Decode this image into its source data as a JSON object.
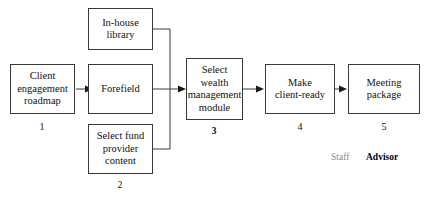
{
  "diagram": {
    "nodes": [
      {
        "id": "in-house-library",
        "label": "In-house\nlibrary",
        "number": "",
        "number_bold": false
      },
      {
        "id": "client-engagement",
        "label": "Client\nengagement\nroadmap",
        "number": "1",
        "number_bold": false
      },
      {
        "id": "forefield",
        "label": "Forefield",
        "number": "",
        "number_bold": false
      },
      {
        "id": "select-fund-provider",
        "label": "Select fund\nprovider\ncontent",
        "number": "2",
        "number_bold": false
      },
      {
        "id": "select-wealth-module",
        "label": "Select\nwealth\nmanagement\nmodule",
        "number": "3",
        "number_bold": true
      },
      {
        "id": "make-client-ready",
        "label": "Make\nclient-ready",
        "number": "4",
        "number_bold": false
      },
      {
        "id": "meeting-package",
        "label": "Meeting\npackage",
        "number": "5",
        "number_bold": false
      }
    ],
    "legend": {
      "staff": "Staff",
      "advisor": "Advisor",
      "staff_color": "#8a8a8a",
      "advisor_color": "#000000"
    },
    "colors": {
      "box_border": "#3a3a3a",
      "box_fill": "#ffffff",
      "connector": "#3a3a3a",
      "text": "#111111"
    }
  }
}
